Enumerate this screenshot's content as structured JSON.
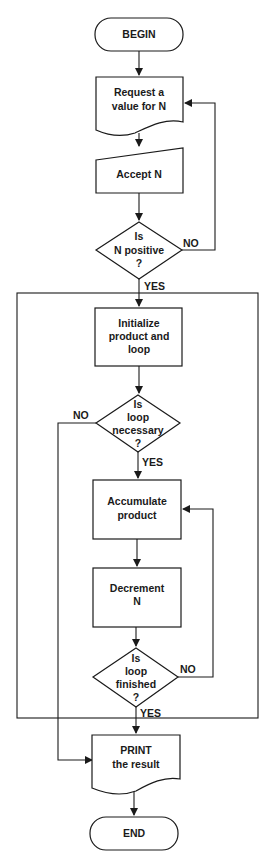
{
  "diagram": {
    "type": "flowchart",
    "nodes": {
      "begin": {
        "shape": "terminator",
        "lines": [
          "BEGIN"
        ]
      },
      "request": {
        "shape": "document",
        "lines": [
          "Request a",
          "value for N"
        ]
      },
      "accept": {
        "shape": "manual-input",
        "lines": [
          "Accept N"
        ]
      },
      "is_positive": {
        "shape": "decision",
        "lines": [
          "Is",
          "N positive",
          "?"
        ]
      },
      "initialize": {
        "shape": "process",
        "lines": [
          "Initialize",
          "product and",
          "loop"
        ]
      },
      "loop_necessary": {
        "shape": "decision",
        "lines": [
          "Is",
          "loop",
          "necessary",
          "?"
        ]
      },
      "accumulate": {
        "shape": "process",
        "lines": [
          "Accumulate",
          "product"
        ]
      },
      "decrement": {
        "shape": "process",
        "lines": [
          "Decrement",
          "N"
        ]
      },
      "loop_finished": {
        "shape": "decision",
        "lines": [
          "Is",
          "loop",
          "finished",
          "?"
        ]
      },
      "print": {
        "shape": "document",
        "lines": [
          "PRINT",
          "the result"
        ]
      },
      "end": {
        "shape": "terminator",
        "lines": [
          "END"
        ]
      }
    },
    "edge_labels": {
      "positive_no": "NO",
      "positive_yes": "YES",
      "necessary_no": "NO",
      "necessary_yes": "YES",
      "finished_no": "NO",
      "finished_yes": "YES"
    },
    "edges": [
      {
        "from": "begin",
        "to": "request"
      },
      {
        "from": "request",
        "to": "accept"
      },
      {
        "from": "accept",
        "to": "is_positive"
      },
      {
        "from": "is_positive",
        "to": "request",
        "label": "NO"
      },
      {
        "from": "is_positive",
        "to": "initialize",
        "label": "YES"
      },
      {
        "from": "initialize",
        "to": "loop_necessary"
      },
      {
        "from": "loop_necessary",
        "to": "print",
        "label": "NO"
      },
      {
        "from": "loop_necessary",
        "to": "accumulate",
        "label": "YES"
      },
      {
        "from": "accumulate",
        "to": "decrement"
      },
      {
        "from": "decrement",
        "to": "loop_finished"
      },
      {
        "from": "loop_finished",
        "to": "accumulate",
        "label": "NO"
      },
      {
        "from": "loop_finished",
        "to": "print",
        "label": "YES"
      },
      {
        "from": "print",
        "to": "end"
      }
    ]
  }
}
